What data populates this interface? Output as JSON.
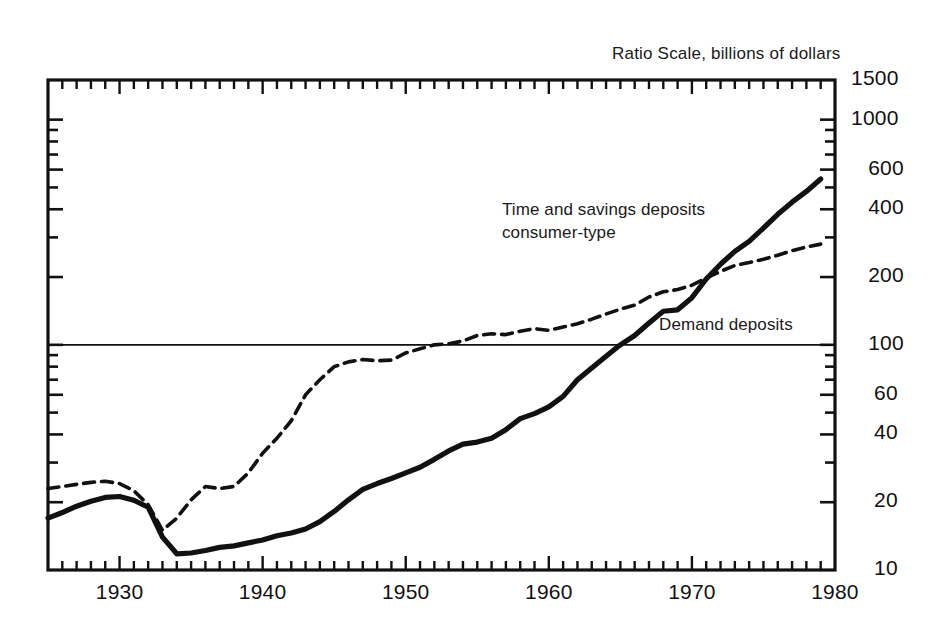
{
  "chart_data": {
    "type": "line",
    "title": "",
    "subtitle": "",
    "axis_note": "Ratio Scale, billions of dollars",
    "xlabel": "",
    "ylabel": "",
    "scale": "log",
    "grid": false,
    "legend_position": "inline-annotations",
    "xlim": [
      1925,
      1980
    ],
    "ylim": [
      10,
      1500
    ],
    "x_tick_labels": [
      "1930",
      "1940",
      "1950",
      "1960",
      "1970",
      "1980"
    ],
    "x_tick_values": [
      1930,
      1940,
      1950,
      1960,
      1970,
      1980
    ],
    "x_minor_tick_interval": 1,
    "y_tick_labels": [
      "1500",
      "1000",
      "600",
      "400",
      "200",
      "100",
      "60",
      "40",
      "20",
      "10"
    ],
    "y_tick_values": [
      1500,
      1000,
      600,
      400,
      200,
      100,
      60,
      40,
      20,
      10
    ],
    "reference_line": {
      "value": 100,
      "label": ""
    },
    "annotations": [
      {
        "name": "time-savings-label",
        "text_line1": "Time and savings deposits",
        "text_line2": "consumer-type",
        "x": 1953,
        "y": 330
      },
      {
        "name": "demand-label",
        "text_line1": "Demand deposits",
        "text_line2": "",
        "x": 1967,
        "y": 118
      }
    ],
    "series": [
      {
        "name": "Time and savings deposits consumer-type",
        "style": "solid",
        "color": "#111111",
        "x": [
          1925,
          1926,
          1927,
          1928,
          1929,
          1930,
          1931,
          1932,
          1933,
          1934,
          1935,
          1936,
          1937,
          1938,
          1939,
          1940,
          1941,
          1942,
          1943,
          1944,
          1945,
          1946,
          1947,
          1948,
          1949,
          1950,
          1951,
          1952,
          1953,
          1954,
          1955,
          1956,
          1957,
          1958,
          1959,
          1960,
          1961,
          1962,
          1963,
          1964,
          1965,
          1966,
          1967,
          1968,
          1969,
          1970,
          1971,
          1972,
          1973,
          1974,
          1975,
          1976,
          1977,
          1978,
          1979
        ],
        "values": [
          17.0,
          18.0,
          19.2,
          20.2,
          21.0,
          21.2,
          20.4,
          19.0,
          14.0,
          11.8,
          11.9,
          12.2,
          12.6,
          12.8,
          13.2,
          13.6,
          14.2,
          14.6,
          15.2,
          16.4,
          18.2,
          20.5,
          22.8,
          24.2,
          25.5,
          27.0,
          28.6,
          31.0,
          33.8,
          36.2,
          37.0,
          38.5,
          42.0,
          47.0,
          49.5,
          53.0,
          59.0,
          70.0,
          79.0,
          89.0,
          100.0,
          110.0,
          125.0,
          141.0,
          143.0,
          162.0,
          196.0,
          228.0,
          260.0,
          288.0,
          330.0,
          380.0,
          430.0,
          480.0,
          545.0
        ]
      },
      {
        "name": "Demand deposits",
        "style": "dashed",
        "color": "#111111",
        "x": [
          1925,
          1926,
          1927,
          1928,
          1929,
          1930,
          1931,
          1932,
          1933,
          1934,
          1935,
          1936,
          1937,
          1938,
          1939,
          1940,
          1941,
          1942,
          1943,
          1944,
          1945,
          1946,
          1947,
          1948,
          1949,
          1950,
          1951,
          1952,
          1953,
          1954,
          1955,
          1956,
          1957,
          1958,
          1959,
          1960,
          1961,
          1962,
          1963,
          1964,
          1965,
          1966,
          1967,
          1968,
          1969,
          1970,
          1971,
          1972,
          1973,
          1974,
          1975,
          1976,
          1977,
          1978,
          1979
        ],
        "values": [
          23.0,
          23.5,
          24.0,
          24.5,
          24.8,
          24.2,
          22.5,
          19.5,
          15.0,
          17.0,
          20.5,
          23.5,
          23.0,
          23.5,
          27.0,
          33.0,
          38.5,
          46.0,
          60.0,
          70.0,
          80.0,
          84.0,
          86.0,
          85.0,
          85.5,
          92.0,
          96.0,
          100.0,
          101.0,
          104.0,
          110.0,
          112.0,
          111.0,
          115.0,
          118.0,
          116.0,
          120.0,
          124.0,
          130.0,
          137.0,
          144.0,
          150.0,
          163.0,
          172.0,
          176.0,
          184.0,
          198.0,
          212.0,
          225.0,
          232.0,
          240.0,
          250.0,
          262.0,
          272.0,
          280.0
        ]
      }
    ]
  },
  "plot": {
    "left": 48,
    "top": 80,
    "right": 835,
    "bottom": 570
  }
}
